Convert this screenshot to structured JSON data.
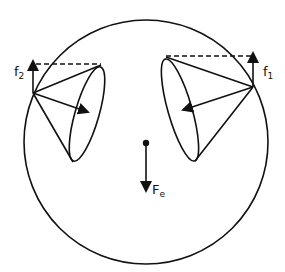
{
  "diagram": {
    "title": "",
    "labels": {
      "f2": {
        "main": "f",
        "sub": "2"
      },
      "f1": {
        "main": "f",
        "sub": "1"
      },
      "Fe": {
        "main": "F",
        "sub": "e"
      }
    },
    "elements": [
      {
        "id": "outer-circle",
        "type": "circle"
      },
      {
        "id": "left-cone",
        "type": "cone",
        "arrow": "inward",
        "force_label": "f2"
      },
      {
        "id": "right-cone",
        "type": "cone",
        "arrow": "inward",
        "force_label": "f1"
      },
      {
        "id": "center-mass",
        "type": "dot",
        "force_label": "Fe",
        "force_direction": "down"
      }
    ],
    "colors": {
      "stroke": "#111111",
      "background": "#ffffff"
    }
  }
}
